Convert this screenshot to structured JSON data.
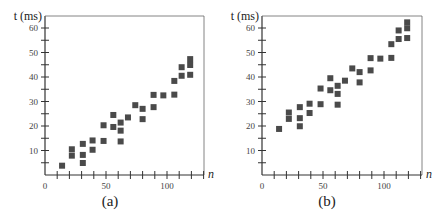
{
  "chart_data": [
    {
      "type": "scatter",
      "caption": "(a)",
      "title": "",
      "xlabel": "n",
      "ylabel": "t (ms)",
      "xlim": [
        0,
        130
      ],
      "ylim": [
        0,
        65
      ],
      "xticks": [
        0,
        10,
        20,
        30,
        40,
        50,
        60,
        70,
        80,
        90,
        100,
        110,
        120,
        130
      ],
      "xtick_labels": [
        "0",
        "50",
        "100"
      ],
      "yticks": [
        5,
        10,
        15,
        20,
        25,
        30,
        35,
        40,
        45,
        50,
        55,
        60
      ],
      "ytick_labels": [
        "10",
        "20",
        "30",
        "40",
        "50",
        "60"
      ],
      "grid": false,
      "legend": null,
      "points": [
        [
          14,
          3.8
        ],
        [
          22,
          10.5
        ],
        [
          22,
          7.9
        ],
        [
          31,
          12.7
        ],
        [
          31,
          8.2
        ],
        [
          31,
          4.9
        ],
        [
          39,
          14.1
        ],
        [
          39,
          10.3
        ],
        [
          48,
          20.3
        ],
        [
          48,
          13.9
        ],
        [
          56,
          24.5
        ],
        [
          56,
          19.6
        ],
        [
          62,
          21.4
        ],
        [
          62,
          18.1
        ],
        [
          62,
          13.7
        ],
        [
          68,
          23.5
        ],
        [
          74,
          28.5
        ],
        [
          80,
          27.0
        ],
        [
          80,
          22.8
        ],
        [
          89,
          32.7
        ],
        [
          89,
          27.7
        ],
        [
          97,
          32.5
        ],
        [
          106,
          38.4
        ],
        [
          106,
          32.8
        ],
        [
          112,
          44.0
        ],
        [
          112,
          40.5
        ],
        [
          119,
          47.3
        ],
        [
          119,
          44.9
        ],
        [
          119,
          40.9
        ]
      ]
    },
    {
      "type": "scatter",
      "caption": "(b)",
      "title": "",
      "xlabel": "n",
      "ylabel": "t (ms)",
      "xlim": [
        0,
        130
      ],
      "ylim": [
        0,
        65
      ],
      "xticks": [
        0,
        10,
        20,
        30,
        40,
        50,
        60,
        70,
        80,
        90,
        100,
        110,
        120,
        130
      ],
      "xtick_labels": [
        "0",
        "50",
        "100"
      ],
      "yticks": [
        5,
        10,
        15,
        20,
        25,
        30,
        35,
        40,
        45,
        50,
        55,
        60
      ],
      "ytick_labels": [
        "10",
        "20",
        "30",
        "40",
        "50",
        "60"
      ],
      "grid": false,
      "legend": null,
      "points": [
        [
          14,
          18.8
        ],
        [
          22,
          25.5
        ],
        [
          22,
          22.9
        ],
        [
          31,
          27.7
        ],
        [
          31,
          23.2
        ],
        [
          31,
          19.9
        ],
        [
          39,
          29.1
        ],
        [
          39,
          25.3
        ],
        [
          48,
          35.3
        ],
        [
          48,
          28.9
        ],
        [
          56,
          39.5
        ],
        [
          56,
          34.6
        ],
        [
          62,
          36.4
        ],
        [
          62,
          33.1
        ],
        [
          62,
          28.7
        ],
        [
          68,
          38.5
        ],
        [
          74,
          43.5
        ],
        [
          80,
          42.0
        ],
        [
          80,
          37.8
        ],
        [
          89,
          47.7
        ],
        [
          89,
          42.7
        ],
        [
          97,
          47.5
        ],
        [
          106,
          53.4
        ],
        [
          106,
          47.8
        ],
        [
          112,
          59.0
        ],
        [
          112,
          55.5
        ],
        [
          119,
          62.3
        ],
        [
          119,
          59.9
        ],
        [
          119,
          55.9
        ]
      ]
    }
  ],
  "style": {
    "marker_color": "#4a4a4a",
    "axis_color": "#333333"
  }
}
